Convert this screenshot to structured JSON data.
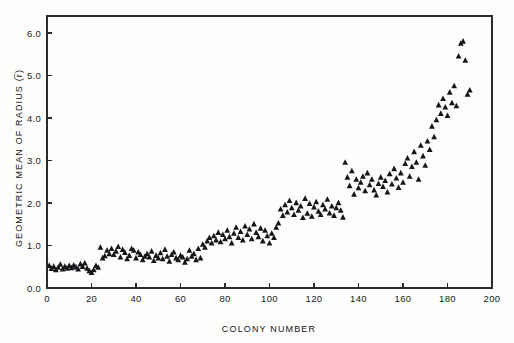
{
  "chart_data": {
    "type": "scatter",
    "title": "",
    "xlabel": "COLONY NUMBER",
    "ylabel": "GEOMETRIC MEAN OF RADIUS (r̅)",
    "xlim": [
      0,
      200
    ],
    "ylim": [
      0.0,
      6.4
    ],
    "xticks": [
      0,
      20,
      40,
      60,
      80,
      100,
      120,
      140,
      160,
      180,
      200
    ],
    "xtick_labels": [
      "0",
      "20",
      "40",
      "60",
      "80",
      "100",
      "120",
      "140",
      "160",
      "180",
      "200"
    ],
    "yticks": [
      0.0,
      1.0,
      2.0,
      3.0,
      4.0,
      5.0,
      6.0
    ],
    "ytick_labels": [
      "0.0",
      "1.0",
      "2.0",
      "3.0",
      "4.0",
      "5.0",
      "6.0"
    ],
    "grid": false,
    "legend": null,
    "marker": "triangle",
    "marker_color": "#15151a",
    "marker_size": 3.4,
    "series": [
      {
        "name": "colony radius",
        "x": [
          1,
          2,
          3,
          4,
          5,
          6,
          7,
          8,
          9,
          10,
          11,
          12,
          13,
          14,
          15,
          16,
          17,
          18,
          19,
          20,
          21,
          22,
          23,
          24,
          25,
          26,
          27,
          28,
          29,
          30,
          31,
          32,
          33,
          34,
          35,
          36,
          37,
          38,
          39,
          40,
          41,
          42,
          43,
          44,
          45,
          46,
          47,
          48,
          49,
          50,
          51,
          52,
          53,
          54,
          55,
          56,
          57,
          58,
          59,
          60,
          61,
          62,
          63,
          64,
          65,
          66,
          67,
          68,
          69,
          70,
          71,
          72,
          73,
          74,
          75,
          76,
          77,
          78,
          79,
          80,
          81,
          82,
          83,
          84,
          85,
          86,
          87,
          88,
          89,
          90,
          91,
          92,
          93,
          94,
          95,
          96,
          97,
          98,
          99,
          100,
          101,
          102,
          103,
          104,
          105,
          106,
          107,
          108,
          109,
          110,
          111,
          112,
          113,
          114,
          115,
          116,
          117,
          118,
          119,
          120,
          121,
          122,
          123,
          124,
          125,
          126,
          127,
          128,
          129,
          130,
          131,
          132,
          133,
          134,
          135,
          136,
          137,
          138,
          139,
          140,
          141,
          142,
          143,
          144,
          145,
          146,
          147,
          148,
          149,
          150,
          151,
          152,
          153,
          154,
          155,
          156,
          157,
          158,
          159,
          160,
          161,
          162,
          163,
          164,
          165,
          166,
          167,
          168,
          169,
          170,
          171,
          172,
          173,
          174,
          175,
          176,
          177,
          178,
          179,
          180,
          181,
          182,
          183,
          184,
          185,
          186,
          187,
          188,
          189,
          190
        ],
        "y": [
          0.52,
          0.45,
          0.5,
          0.42,
          0.48,
          0.55,
          0.44,
          0.5,
          0.46,
          0.52,
          0.47,
          0.53,
          0.49,
          0.44,
          0.56,
          0.5,
          0.58,
          0.46,
          0.4,
          0.36,
          0.42,
          0.52,
          0.48,
          0.95,
          0.7,
          0.75,
          0.88,
          0.8,
          0.92,
          0.78,
          0.86,
          0.97,
          0.72,
          0.9,
          0.83,
          0.68,
          0.76,
          0.92,
          0.88,
          0.7,
          0.84,
          0.78,
          0.66,
          0.74,
          0.8,
          0.72,
          0.86,
          0.64,
          0.76,
          0.7,
          0.82,
          0.68,
          0.9,
          0.74,
          0.62,
          0.78,
          0.84,
          0.7,
          0.66,
          0.76,
          0.72,
          0.6,
          0.68,
          0.88,
          0.74,
          0.8,
          0.66,
          0.92,
          0.7,
          1.02,
          0.95,
          1.1,
          1.18,
          1.05,
          1.22,
          1.12,
          1.3,
          1.08,
          1.25,
          1.15,
          1.35,
          1.2,
          1.05,
          1.28,
          1.42,
          1.18,
          1.32,
          1.12,
          1.45,
          1.25,
          1.38,
          1.15,
          1.5,
          1.3,
          1.2,
          1.4,
          1.1,
          1.35,
          1.22,
          1.05,
          1.28,
          1.18,
          1.42,
          1.52,
          1.85,
          1.7,
          1.95,
          1.78,
          2.05,
          1.88,
          1.72,
          2.0,
          1.82,
          1.92,
          1.65,
          2.1,
          1.75,
          1.98,
          1.68,
          1.9,
          2.02,
          1.8,
          1.72,
          1.95,
          1.85,
          2.08,
          1.76,
          1.92,
          1.7,
          1.88,
          2.0,
          1.82,
          1.66,
          2.95,
          2.6,
          2.4,
          2.75,
          2.2,
          2.55,
          2.35,
          2.48,
          2.62,
          2.28,
          2.7,
          2.42,
          2.55,
          2.3,
          2.18,
          2.45,
          2.6,
          2.38,
          2.52,
          2.25,
          2.68,
          2.44,
          2.8,
          2.58,
          2.36,
          2.7,
          2.48,
          2.92,
          3.05,
          2.62,
          2.85,
          3.2,
          2.95,
          2.55,
          3.35,
          3.1,
          2.88,
          3.45,
          3.25,
          3.8,
          3.55,
          3.95,
          4.3,
          4.1,
          4.45,
          4.25,
          4.05,
          4.6,
          4.35,
          4.75,
          4.28,
          5.45,
          5.75,
          5.8,
          5.35,
          4.55,
          4.65
        ]
      }
    ]
  },
  "figure": {
    "background_color": "#fdfdfc",
    "axis_color": "#2b2b2b",
    "text_color": "#1a1a1a"
  }
}
